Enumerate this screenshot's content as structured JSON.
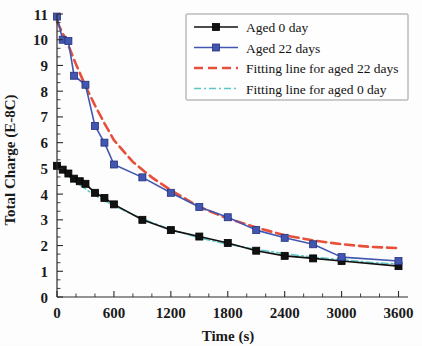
{
  "chart_data": {
    "type": "line",
    "title": "",
    "xlabel": "Time (s)",
    "ylabel": "Total Charge (E-8C)",
    "xlim": [
      0,
      3700
    ],
    "ylim": [
      0,
      11
    ],
    "xticks": [
      0,
      600,
      1200,
      1800,
      2400,
      3000,
      3600
    ],
    "xtick_labels": [
      "0",
      "600",
      "1200",
      "1800",
      "2400",
      "3000",
      "3600"
    ],
    "x_minor_count": 2,
    "yticks": [
      0,
      1,
      2,
      3,
      4,
      5,
      6,
      7,
      8,
      9,
      10,
      11
    ],
    "ytick_labels": [
      "0",
      "1",
      "2",
      "3",
      "4",
      "5",
      "6",
      "7",
      "8",
      "9",
      "10",
      "11"
    ],
    "y_minor_count": 2,
    "grid": false,
    "legend_position": "top-right",
    "series": [
      {
        "name": "Aged 0 day",
        "style": "markers-line",
        "color": "#111111",
        "marker": "square-filled",
        "marker_size": 7,
        "line_width": 1.6,
        "dash": "none",
        "x": [
          0,
          60,
          120,
          180,
          240,
          300,
          400,
          500,
          600,
          900,
          1200,
          1500,
          1800,
          2100,
          2400,
          2700,
          3000,
          3600
        ],
        "y": [
          5.1,
          4.95,
          4.8,
          4.6,
          4.5,
          4.4,
          4.05,
          3.85,
          3.6,
          3.0,
          2.6,
          2.35,
          2.1,
          1.8,
          1.6,
          1.5,
          1.4,
          1.2
        ]
      },
      {
        "name": "Aged 22 days",
        "style": "markers-line",
        "color": "#4257b2",
        "marker": "square-filled",
        "marker_size": 7,
        "line_width": 1.6,
        "dash": "none",
        "x": [
          0,
          60,
          120,
          180,
          300,
          400,
          500,
          600,
          900,
          1200,
          1500,
          1800,
          2100,
          2400,
          2700,
          3000,
          3600
        ],
        "y": [
          10.9,
          10.0,
          9.95,
          8.6,
          8.25,
          6.65,
          6.0,
          5.15,
          4.65,
          4.05,
          3.5,
          3.1,
          2.6,
          2.3,
          2.05,
          1.55,
          1.4
        ]
      },
      {
        "name": "Fitting line for aged 22 days",
        "style": "line",
        "color": "#e8503a",
        "marker": "none",
        "marker_size": 0,
        "line_width": 2.6,
        "dash": "9,5",
        "x": [
          0,
          100,
          200,
          300,
          400,
          500,
          600,
          800,
          1000,
          1200,
          1500,
          1800,
          2100,
          2400,
          2700,
          3000,
          3300,
          3600
        ],
        "y": [
          10.7,
          9.95,
          9.05,
          8.2,
          7.45,
          6.75,
          6.1,
          5.25,
          4.65,
          4.15,
          3.5,
          3.05,
          2.7,
          2.4,
          2.2,
          2.05,
          1.95,
          1.9
        ]
      },
      {
        "name": "Fitting line for aged 0 day",
        "style": "line",
        "color": "#5fc8c8",
        "marker": "none",
        "marker_size": 0,
        "line_width": 1.5,
        "dash": "7,3,2,3",
        "x": [
          0,
          100,
          200,
          300,
          400,
          500,
          600,
          800,
          1000,
          1200,
          1500,
          1800,
          2100,
          2400,
          2700,
          3000,
          3300,
          3600
        ],
        "y": [
          5.1,
          4.75,
          4.45,
          4.2,
          3.95,
          3.75,
          3.55,
          3.2,
          2.9,
          2.62,
          2.3,
          2.05,
          1.85,
          1.68,
          1.55,
          1.45,
          1.35,
          1.28
        ]
      }
    ]
  },
  "legend": {
    "entries": [
      {
        "label": "Aged 0 day"
      },
      {
        "label": "Aged 22 days"
      },
      {
        "label": "Fitting line for aged 22 days"
      },
      {
        "label": "Fitting line for aged 0 day"
      }
    ]
  },
  "colors": {
    "aged_0_day": "#111111",
    "aged_22_days": "#4257b2",
    "fit_22_days": "#e8503a",
    "fit_0_day": "#5fc8c8",
    "axis": "#2a2a2a"
  }
}
